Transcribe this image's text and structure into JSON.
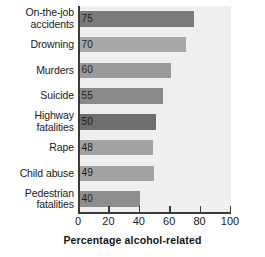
{
  "chart_data": {
    "type": "bar",
    "orientation": "horizontal",
    "title": "",
    "xlabel": "Percentage alcohol-related",
    "ylabel": "",
    "xlim": [
      0,
      100
    ],
    "xticks": [
      0,
      20,
      40,
      60,
      80,
      100
    ],
    "grid": false,
    "legend": "none",
    "categories": [
      "On-the-job\naccidents",
      "Drowning",
      "Murders",
      "Suicide",
      "Highway\nfatalities",
      "Rape",
      "Child abuse",
      "Pedestrian\nfatalities"
    ],
    "values": [
      75,
      70,
      60,
      55,
      50,
      48,
      49,
      40
    ],
    "value_labels": [
      "75",
      "70",
      "60",
      "55",
      "50",
      "48",
      "49",
      "40"
    ],
    "bar_colors": [
      "#7b7b7b",
      "#a8a8a8",
      "#9a9a9a",
      "#8a8a8a",
      "#6e6e6e",
      "#a3a3a3",
      "#a3a3a3",
      "#8e8e8e"
    ],
    "plot_background": "#efefef",
    "axis_color": "#3a3a3a",
    "text_color": "#191919"
  },
  "axis": {
    "tick_labels": [
      "0",
      "20",
      "40",
      "60",
      "80",
      "100"
    ],
    "x_title": "Percentage alcohol-related"
  }
}
